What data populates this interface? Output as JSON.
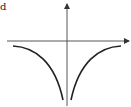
{
  "figure": {
    "corner_label": "d",
    "axes": {
      "x_arrow": true,
      "y_arrow": true,
      "color": "#333333"
    },
    "curve_color": "#222222"
  }
}
